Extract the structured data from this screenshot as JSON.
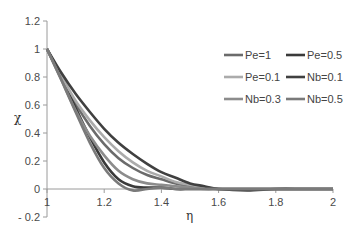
{
  "chart_data": {
    "type": "line",
    "title": "",
    "xlabel": "η",
    "ylabel": "χ",
    "xlim": [
      1,
      2
    ],
    "ylim": [
      -0.2,
      1.2
    ],
    "xticks": [
      "1",
      "1.2",
      "1.4",
      "1.6",
      "1.8",
      "2"
    ],
    "yticks": [
      "1.2",
      "1",
      "0.8",
      "0.6",
      "0.4",
      "0.2",
      "0",
      "- 0.2"
    ],
    "grid": false,
    "legend_position": "upper-right, 2 columns",
    "x": [
      1.0,
      1.05,
      1.1,
      1.15,
      1.2,
      1.25,
      1.3,
      1.35,
      1.4,
      1.45,
      1.5,
      1.55,
      1.6,
      1.7,
      1.8,
      1.9,
      2.0
    ],
    "series": [
      {
        "name": "Pe=1",
        "color": "#6b6b6b",
        "values": [
          1.0,
          0.8,
          0.61,
          0.45,
          0.32,
          0.22,
          0.15,
          0.1,
          0.07,
          0.04,
          0.02,
          0.01,
          0.0,
          0.0,
          0.0,
          0.0,
          0.0
        ]
      },
      {
        "name": "Pe=0.5",
        "color": "#3a3a3a",
        "values": [
          1.0,
          0.79,
          0.58,
          0.37,
          0.19,
          0.07,
          0.02,
          0.01,
          0.01,
          0.0,
          0.0,
          0.0,
          0.0,
          0.0,
          0.0,
          0.0,
          0.0
        ]
      },
      {
        "name": "Pe=0.1",
        "color": "#ababab",
        "values": [
          1.0,
          0.81,
          0.63,
          0.49,
          0.37,
          0.27,
          0.19,
          0.13,
          0.09,
          0.05,
          0.03,
          0.01,
          0.0,
          0.0,
          0.0,
          0.0,
          0.0
        ]
      },
      {
        "name": "Nb=0.1",
        "color": "#404040",
        "values": [
          1.0,
          0.83,
          0.68,
          0.55,
          0.43,
          0.33,
          0.25,
          0.18,
          0.12,
          0.08,
          0.04,
          0.02,
          0.0,
          -0.01,
          0.0,
          0.0,
          0.0
        ]
      },
      {
        "name": "Nb=0.3",
        "color": "#8c8c8c",
        "values": [
          1.0,
          0.78,
          0.56,
          0.38,
          0.24,
          0.13,
          0.07,
          0.04,
          0.03,
          0.02,
          0.01,
          0.0,
          0.0,
          0.0,
          0.0,
          0.0,
          0.0
        ]
      },
      {
        "name": "Nb=0.5",
        "color": "#7a7a7a",
        "values": [
          1.0,
          0.78,
          0.55,
          0.33,
          0.15,
          0.04,
          -0.01,
          0.0,
          0.01,
          0.0,
          0.0,
          0.0,
          0.0,
          0.0,
          0.0,
          0.0,
          0.0
        ]
      }
    ]
  }
}
